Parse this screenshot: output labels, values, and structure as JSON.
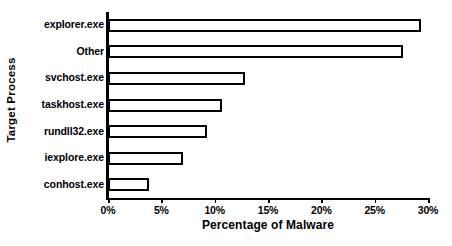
{
  "chart_data": {
    "type": "bar",
    "orientation": "horizontal",
    "title": "",
    "xlabel": "Percentage of Malware",
    "ylabel": "Target Process",
    "categories": [
      "explorer.exe",
      "Other",
      "svchost.exe",
      "taskhost.exe",
      "rundll32.exe",
      "iexplore.exe",
      "conhost.exe"
    ],
    "values": [
      29.3,
      27.7,
      12.8,
      10.7,
      9.3,
      7.0,
      3.8
    ],
    "value_unit": "%",
    "xlim": [
      0,
      30
    ],
    "xticks": [
      0,
      5,
      10,
      15,
      20,
      25,
      30
    ],
    "xtick_labels": [
      "0%",
      "5%",
      "10%",
      "15%",
      "20%",
      "25%",
      "30%"
    ],
    "grid": false,
    "legend": false,
    "bar_fill_color": "#ffffff",
    "bar_edge_color": "#000000",
    "axis_color": "#000000",
    "background_color": "#ffffff"
  }
}
